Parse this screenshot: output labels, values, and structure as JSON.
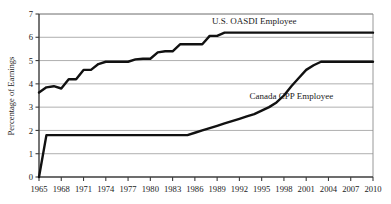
{
  "chart_data": {
    "type": "line",
    "title": "",
    "xlabel": "",
    "ylabel": "Percentage of Earnings",
    "xlim": [
      1965,
      2010
    ],
    "ylim": [
      0,
      7
    ],
    "grid": true,
    "legend_position": "inline-annotation",
    "y_ticks": [
      "0",
      "1",
      "2",
      "3",
      "4",
      "5",
      "6",
      "7"
    ],
    "x_ticks": [
      "1965",
      "1968",
      "1971",
      "1974",
      "1977",
      "1980",
      "1983",
      "1986",
      "1989",
      "1992",
      "1995",
      "1998",
      "2001",
      "2004",
      "2007",
      "2010"
    ],
    "series": [
      {
        "name": "U.S. OASDI Employee",
        "color": "#111111",
        "label_x": 1994,
        "label_y": 6.55,
        "x": [
          1965,
          1966,
          1967,
          1968,
          1969,
          1970,
          1971,
          1972,
          1973,
          1974,
          1975,
          1976,
          1977,
          1978,
          1979,
          1980,
          1981,
          1982,
          1983,
          1984,
          1985,
          1986,
          1987,
          1988,
          1989,
          1990,
          1991,
          1992,
          1993,
          1994,
          1995,
          1996,
          1997,
          1998,
          1999,
          2000,
          2001,
          2002,
          2003,
          2004,
          2005,
          2006,
          2007,
          2008,
          2009,
          2010
        ],
        "values": [
          3.625,
          3.85,
          3.9,
          3.8,
          4.2,
          4.2,
          4.6,
          4.6,
          4.85,
          4.95,
          4.95,
          4.95,
          4.95,
          5.05,
          5.08,
          5.08,
          5.35,
          5.4,
          5.4,
          5.7,
          5.7,
          5.7,
          5.7,
          6.06,
          6.06,
          6.2,
          6.2,
          6.2,
          6.2,
          6.2,
          6.2,
          6.2,
          6.2,
          6.2,
          6.2,
          6.2,
          6.2,
          6.2,
          6.2,
          6.2,
          6.2,
          6.2,
          6.2,
          6.2,
          6.2,
          6.2
        ]
      },
      {
        "name": "Canada CPP Employee",
        "color": "#111111",
        "label_x": 1999,
        "label_y": 3.35,
        "x": [
          1965,
          1966,
          1967,
          1968,
          1969,
          1970,
          1971,
          1972,
          1973,
          1974,
          1975,
          1976,
          1977,
          1978,
          1979,
          1980,
          1981,
          1982,
          1983,
          1984,
          1985,
          1986,
          1987,
          1988,
          1989,
          1990,
          1991,
          1992,
          1993,
          1994,
          1995,
          1996,
          1997,
          1998,
          1999,
          2000,
          2001,
          2002,
          2003,
          2004,
          2005,
          2006,
          2007,
          2008,
          2009,
          2010
        ],
        "values": [
          0,
          1.8,
          1.8,
          1.8,
          1.8,
          1.8,
          1.8,
          1.8,
          1.8,
          1.8,
          1.8,
          1.8,
          1.8,
          1.8,
          1.8,
          1.8,
          1.8,
          1.8,
          1.8,
          1.8,
          1.8,
          1.9,
          2.0,
          2.1,
          2.2,
          2.3,
          2.4,
          2.5,
          2.6,
          2.7,
          2.85,
          3.0,
          3.2,
          3.5,
          3.9,
          4.25,
          4.6,
          4.8,
          4.95,
          4.95,
          4.95,
          4.95,
          4.95,
          4.95,
          4.95,
          4.95
        ]
      }
    ]
  }
}
